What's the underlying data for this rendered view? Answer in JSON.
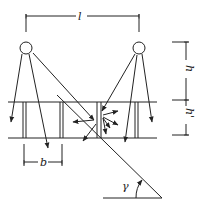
{
  "diagram": {
    "labels": {
      "spacing": "l",
      "height_upper": "h",
      "height_lower": "h'",
      "width": "b",
      "angle": "γ"
    },
    "colors": {
      "stroke": "#222222",
      "background": "#ffffff"
    },
    "elements": {
      "light_sources": 2,
      "horizontal_lines": 2,
      "post_pairs": 4,
      "inclined_line": 1
    }
  }
}
